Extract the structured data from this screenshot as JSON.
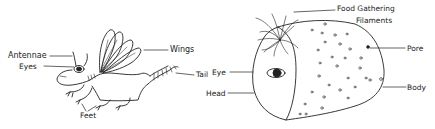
{
  "figure": {
    "left_creature": {
      "name": "dragonfly-lizard",
      "labels": {
        "antennae": "Antennae",
        "eyes": "Eyes",
        "wings": "Wings",
        "tail": "Tail",
        "feet": "Feet"
      }
    },
    "right_creature": {
      "name": "filament-blob",
      "labels": {
        "food_line1": "Food Gathering",
        "food_line2": "Filaments",
        "pore": "Pore",
        "eye": "Eye",
        "head": "Head",
        "body": "Body"
      }
    },
    "colors": {
      "ink": "#222222",
      "background": "#ffffff"
    }
  }
}
